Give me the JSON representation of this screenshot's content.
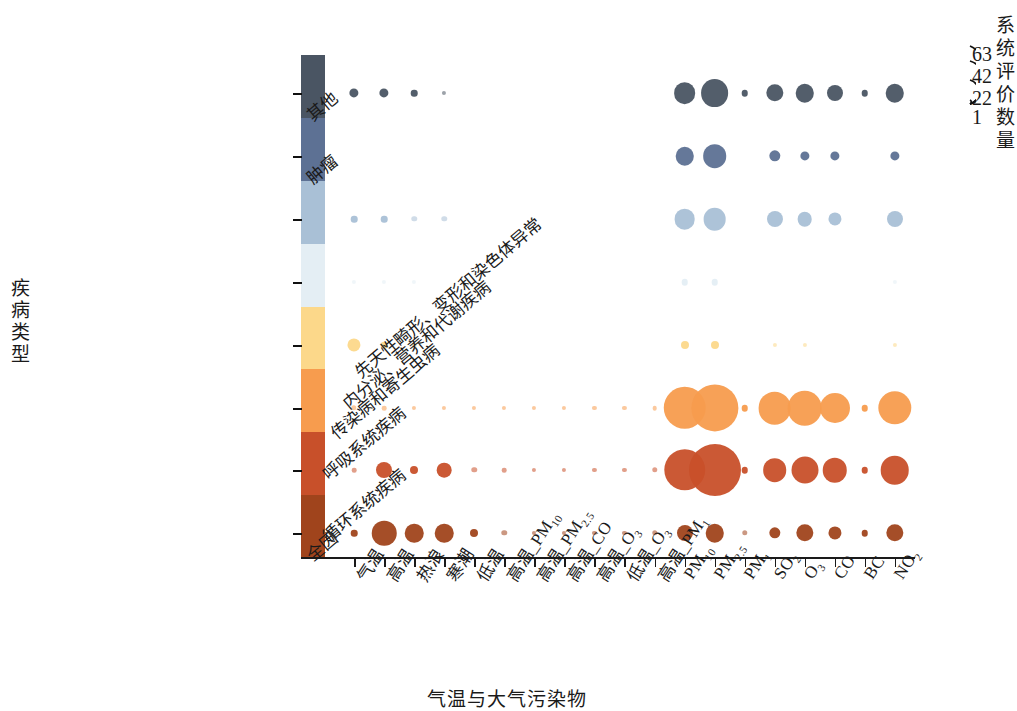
{
  "chart_data": {
    "type": "scatter",
    "subtype": "bubble-matrix",
    "title": "",
    "xlabel": "气温与大气污染物",
    "ylabel": "疾病类型",
    "grid": false,
    "legend": {
      "title": "系统评价数量",
      "position": "top-right",
      "values": [
        63,
        42,
        22,
        1
      ],
      "style": "nested-circles"
    },
    "size_metric": "系统评价数量",
    "size_range": [
      1,
      63
    ],
    "categories_x": [
      "气温",
      "高温",
      "热浪",
      "寒潮",
      "低温",
      "高温_PM10",
      "高温_PM2.5",
      "高温_CO",
      "高温_O3",
      "低温_O3",
      "高温_PM1",
      "PM10",
      "PM2.5",
      "PM1",
      "SO2",
      "O3",
      "CO",
      "BC",
      "NO2"
    ],
    "categories_x_html": [
      "气温",
      "高温",
      "热浪",
      "寒潮",
      "低温",
      "高温_PM<sub>10</sub>",
      "高温_PM<sub>2.5</sub>",
      "高温_CO",
      "高温_O<sub>3</sub>",
      "低温_O<sub>3</sub>",
      "高温_PM<sub>1</sub>",
      "PM<sub>10</sub>",
      "PM<sub>2.5</sub>",
      "PM<sub>1</sub>",
      "SO<sub>2</sub>",
      "O<sub>3</sub>",
      "CO",
      "BC",
      "NO<sub>2</sub>"
    ],
    "categories_y": [
      "其他",
      "肿瘤",
      "先天性畸形、变形和染色体异常",
      "内分泌、营养和代谢疾病",
      "传染病和寄生虫病",
      "呼吸系统疾病",
      "循环系统疾病",
      "全因"
    ],
    "row_colors": [
      "#4a5563",
      "#5d7194",
      "#a9c0d6",
      "#e4eef4",
      "#fcd88a",
      "#f79c4e",
      "#c8502a",
      "#a0441c"
    ],
    "series": [
      {
        "name": "其他",
        "color": "#4a5563",
        "values": [
          2,
          2,
          1,
          0.4,
          0,
          0,
          0,
          0,
          0,
          0,
          0,
          11,
          18,
          1,
          7,
          8,
          6,
          1,
          8
        ]
      },
      {
        "name": "肿瘤",
        "color": "#5d7194",
        "values": [
          0,
          0,
          0,
          0,
          0,
          0,
          0,
          0,
          0,
          0,
          0,
          8,
          13,
          0,
          3,
          2,
          2,
          0,
          2
        ]
      },
      {
        "name": "先天性畸形、变形和染色体异常",
        "color": "#a9c0d6",
        "values": [
          1,
          1,
          0.7,
          0.7,
          0,
          0,
          0,
          0,
          0,
          0,
          0,
          10,
          12,
          0,
          6,
          5,
          4,
          0,
          6
        ]
      },
      {
        "name": "内分泌、营养和代谢疾病",
        "color": "#e4eef4",
        "values": [
          0.4,
          0.4,
          0.4,
          0,
          0,
          0,
          0,
          0,
          0,
          0,
          0,
          1,
          1,
          0,
          0,
          0,
          0,
          0,
          0.4
        ]
      },
      {
        "name": "传染病和寄生虫病",
        "color": "#fcd88a",
        "values": [
          4,
          1,
          0.5,
          0,
          0,
          0,
          0,
          0,
          0,
          0,
          0,
          1.5,
          1.5,
          0,
          0.4,
          0.4,
          0,
          0,
          0.4
        ]
      },
      {
        "name": "呼吸系统疾病",
        "color": "#f79c4e",
        "values": [
          0.7,
          0.5,
          0.4,
          0.4,
          0.4,
          0.4,
          0.4,
          0.4,
          0.4,
          0.4,
          0.5,
          42,
          52,
          1,
          25,
          28,
          21,
          1,
          26
        ]
      },
      {
        "name": "循环系统疾病",
        "color": "#c8502a",
        "values": [
          0.5,
          6,
          1.5,
          5,
          0.7,
          0.5,
          0.4,
          0.4,
          0.4,
          0.4,
          0.7,
          40,
          63,
          1,
          13,
          17,
          14,
          1,
          19
        ]
      },
      {
        "name": "全因",
        "color": "#a0441c",
        "values": [
          1,
          14,
          8,
          8,
          1.5,
          0.7,
          0.4,
          0.4,
          0.4,
          0.4,
          0.7,
          6,
          8,
          0.7,
          3,
          7,
          4,
          1,
          7
        ]
      }
    ]
  },
  "axis": {
    "x_title": "气温与大气污染物",
    "y_title": "疾病类型"
  },
  "legend": {
    "title": "系统评价数量",
    "labels": [
      "63",
      "42",
      "22",
      "1"
    ]
  },
  "colors": {
    "background": "#ffffff",
    "axis": "#1a1a1a",
    "text": "#1a1a1a"
  }
}
